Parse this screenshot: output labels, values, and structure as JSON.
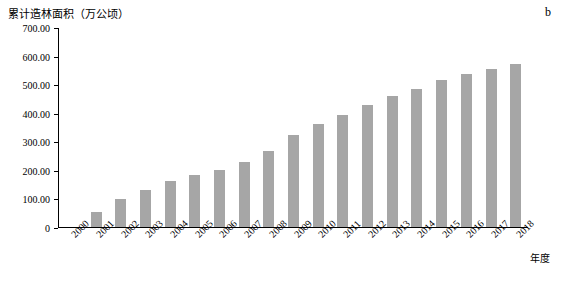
{
  "chart_data": {
    "type": "bar",
    "title": "",
    "panel_label": "b",
    "ylabel": "累计造林面积（万公顷）",
    "xlabel": "年度",
    "ylim": [
      0,
      700
    ],
    "ytick_labels": [
      "700.00",
      "600.00",
      "500.00",
      "400.00",
      "300.00",
      "200.00",
      "100.00",
      "0"
    ],
    "ytick_values": [
      700,
      600,
      500,
      400,
      300,
      200,
      100,
      0
    ],
    "grid": false,
    "legend": "none",
    "bar_color": "#a6a6a6",
    "categories": [
      "2000",
      "2001",
      "2002",
      "2003",
      "2004",
      "2005",
      "2006",
      "2007",
      "2008",
      "2009",
      "2010",
      "2011",
      "2012",
      "2013",
      "2014",
      "2015",
      "2016",
      "2017",
      "2018"
    ],
    "values": [
      0,
      52,
      97,
      130,
      163,
      182,
      202,
      228,
      266,
      323,
      363,
      395,
      428,
      460,
      487,
      516,
      538,
      556,
      574
    ]
  }
}
